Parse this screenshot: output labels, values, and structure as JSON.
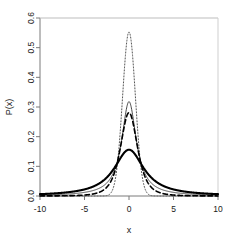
{
  "chart_data": {
    "type": "line",
    "title": "",
    "xlabel": "x",
    "ylabel": "P(x)",
    "xlim": [
      -10,
      10
    ],
    "ylim": [
      0,
      0.6
    ],
    "xticks": [
      -10,
      -5,
      0,
      5,
      10
    ],
    "xticklabels": [
      "-10",
      "-5",
      "0",
      "5",
      "10"
    ],
    "yticks": [
      0.0,
      0.1,
      0.2,
      0.3,
      0.4,
      0.5,
      0.6
    ],
    "yticklabels": [
      "0.0",
      "0.1",
      "0.2",
      "0.3",
      "0.4",
      "0.5",
      "0.6"
    ],
    "grid": false,
    "legend": "none",
    "box": "L-shaped axes",
    "series": [
      {
        "name": "dotted-narrow-peak",
        "linestyle": "dotted",
        "linewidth": 1,
        "color": "#555555",
        "peak_x": 0,
        "peak_y": 0.553,
        "shape": "gaussian",
        "scale": 0.72,
        "x": [
          -10,
          -9,
          -8,
          -7,
          -6,
          -5,
          -4.5,
          -4,
          -3.5,
          -3,
          -2.5,
          -2,
          -1.75,
          -1.5,
          -1.25,
          -1,
          -0.75,
          -0.5,
          -0.25,
          0,
          0.25,
          0.5,
          0.75,
          1,
          1.25,
          1.5,
          1.75,
          2,
          2.5,
          3,
          3.5,
          4,
          4.5,
          5,
          6,
          7,
          8,
          9,
          10
        ],
        "y": [
          0,
          0,
          0,
          0,
          0,
          0,
          0,
          0.0,
          0.0,
          0.005,
          0.004,
          0.025,
          0.05,
          0.088,
          0.139,
          0.205,
          0.283,
          0.366,
          0.459,
          0.553,
          0.459,
          0.366,
          0.283,
          0.205,
          0.139,
          0.088,
          0.05,
          0.025,
          0.004,
          0.005,
          0.0,
          0.0,
          0,
          0,
          0,
          0,
          0,
          0,
          0
        ]
      },
      {
        "name": "thin-solid-cauchy",
        "linestyle": "solid",
        "linewidth": 0.9,
        "color": "#333333",
        "peak_x": 0,
        "peak_y": 0.318,
        "shape": "cauchy",
        "scale": 1.0,
        "x": [
          -10,
          -9,
          -8,
          -7,
          -6,
          -5,
          -4,
          -3,
          -2.5,
          -2,
          -1.5,
          -1,
          -0.75,
          -0.5,
          -0.25,
          0,
          0.25,
          0.5,
          0.75,
          1,
          1.5,
          2,
          2.5,
          3,
          4,
          5,
          6,
          7,
          8,
          9,
          10
        ],
        "y": [
          0.003,
          0.004,
          0.005,
          0.006,
          0.009,
          0.012,
          0.019,
          0.032,
          0.044,
          0.064,
          0.098,
          0.159,
          0.204,
          0.255,
          0.3,
          0.318,
          0.3,
          0.255,
          0.204,
          0.159,
          0.098,
          0.064,
          0.044,
          0.032,
          0.019,
          0.012,
          0.009,
          0.006,
          0.005,
          0.004,
          0.003
        ]
      },
      {
        "name": "dashed-mid-peak",
        "linestyle": "dashed",
        "linewidth": 1.6,
        "color": "#000000",
        "peak_x": 0,
        "peak_y": 0.281,
        "shape": "student-t",
        "scale": 1.0,
        "x": [
          -10,
          -9,
          -8,
          -7,
          -6,
          -5,
          -4,
          -3.5,
          -3,
          -2.5,
          -2,
          -1.5,
          -1.25,
          -1,
          -0.75,
          -0.5,
          -0.25,
          0,
          0.25,
          0.5,
          0.75,
          1,
          1.25,
          1.5,
          2,
          2.5,
          3,
          3.5,
          4,
          5,
          6,
          7,
          8,
          9,
          10
        ],
        "y": [
          0.001,
          0.001,
          0.001,
          0.002,
          0.003,
          0.005,
          0.011,
          0.016,
          0.026,
          0.042,
          0.072,
          0.125,
          0.159,
          0.196,
          0.23,
          0.256,
          0.273,
          0.281,
          0.273,
          0.256,
          0.23,
          0.196,
          0.159,
          0.125,
          0.072,
          0.042,
          0.026,
          0.016,
          0.011,
          0.005,
          0.003,
          0.002,
          0.001,
          0.001,
          0.001
        ]
      },
      {
        "name": "thick-solid-broad",
        "linestyle": "solid",
        "linewidth": 2.1,
        "color": "#000000",
        "peak_x": 0,
        "peak_y": 0.156,
        "shape": "cauchy",
        "scale": 2.04,
        "x": [
          -10,
          -9,
          -8,
          -7,
          -6,
          -5,
          -4,
          -3,
          -2.5,
          -2,
          -1.5,
          -1,
          -0.5,
          0,
          0.5,
          1,
          1.5,
          2,
          2.5,
          3,
          4,
          5,
          6,
          7,
          8,
          9,
          10
        ],
        "y": [
          0.012,
          0.015,
          0.019,
          0.025,
          0.033,
          0.045,
          0.062,
          0.085,
          0.097,
          0.109,
          0.12,
          0.132,
          0.145,
          0.156,
          0.145,
          0.132,
          0.12,
          0.109,
          0.097,
          0.085,
          0.062,
          0.045,
          0.033,
          0.025,
          0.019,
          0.015,
          0.012
        ]
      }
    ]
  },
  "figure": {
    "background": "#ffffff",
    "axis_color": "#6e6e6e",
    "text_color": "#1a1a1a"
  }
}
